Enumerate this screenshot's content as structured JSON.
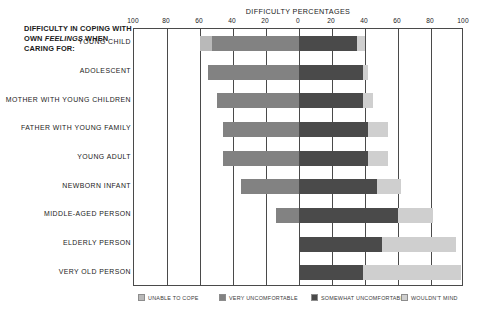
{
  "title_block": {
    "line1": "DIFFICULTY IN COPING WITH",
    "line2_pre": "OWN ",
    "line2_em": "FEELINGS",
    "line2_post": " WHEN",
    "line3": "CARING FOR:"
  },
  "axis": {
    "title": "DIFFICULTY PERCENTAGES",
    "tick_labels": [
      "100",
      "80",
      "60",
      "40",
      "20",
      "0",
      "20",
      "40",
      "60",
      "80",
      "100"
    ]
  },
  "legend": {
    "items": [
      {
        "label": "UNABLE TO COPE",
        "color": "#b9b9b9"
      },
      {
        "label": "VERY UNCOMFORTABLE",
        "color": "#828282"
      },
      {
        "label": "SOMEWHAT UNCOMFORTABLE",
        "color": "#4a4a4a"
      },
      {
        "label": "WOULDN'T MIND",
        "color": "#cfcfcf"
      }
    ]
  },
  "chart_data": {
    "type": "bar",
    "subtype": "diverging-stacked-horizontal",
    "title": "DIFFICULTY PERCENTAGES",
    "xlabel": "DIFFICULTY PERCENTAGES",
    "ylabel": "DIFFICULTY IN COPING WITH OWN FEELINGS WHEN CARING FOR:",
    "xlim": [
      -100,
      100
    ],
    "xticks": [
      -100,
      -80,
      -60,
      -40,
      -20,
      0,
      20,
      40,
      60,
      80,
      100
    ],
    "xtick_labels": [
      "100",
      "80",
      "60",
      "40",
      "20",
      "0",
      "20",
      "40",
      "60",
      "80",
      "100"
    ],
    "grid": true,
    "legend_position": "bottom",
    "categories": [
      "YOUNG CHILD",
      "ADOLESCENT",
      "MOTHER WITH YOUNG CHILDREN",
      "FATHER WITH YOUNG FAMILY",
      "YOUNG ADULT",
      "NEWBORN INFANT",
      "MIDDLE-AGED PERSON",
      "ELDERLY PERSON",
      "VERY OLD PERSON"
    ],
    "series": [
      {
        "name": "UNABLE TO COPE",
        "color": "#b9b9b9",
        "side": "left",
        "values": [
          7,
          0,
          0,
          0,
          0,
          0,
          0,
          0,
          0
        ]
      },
      {
        "name": "VERY UNCOMFORTABLE",
        "color": "#828282",
        "side": "left",
        "values": [
          53,
          55,
          50,
          46,
          46,
          35,
          14,
          0,
          0
        ]
      },
      {
        "name": "SOMEWHAT UNCOMFORTABLE",
        "color": "#4a4a4a",
        "side": "right",
        "values": [
          35,
          39,
          39,
          42,
          42,
          47,
          60,
          50,
          39
        ]
      },
      {
        "name": "WOULDN'T MIND",
        "color": "#cfcfcf",
        "side": "right",
        "values": [
          5,
          3,
          6,
          12,
          12,
          15,
          21,
          45,
          59
        ]
      }
    ],
    "rows": [
      {
        "category": "YOUNG CHILD",
        "unable_to_cope": 7,
        "very_uncomfortable": 53,
        "somewhat_uncomfortable": 35,
        "wouldnt_mind": 5
      },
      {
        "category": "ADOLESCENT",
        "unable_to_cope": 0,
        "very_uncomfortable": 55,
        "somewhat_uncomfortable": 39,
        "wouldnt_mind": 3
      },
      {
        "category": "MOTHER WITH YOUNG CHILDREN",
        "unable_to_cope": 0,
        "very_uncomfortable": 50,
        "somewhat_uncomfortable": 39,
        "wouldnt_mind": 6
      },
      {
        "category": "FATHER WITH YOUNG FAMILY",
        "unable_to_cope": 0,
        "very_uncomfortable": 46,
        "somewhat_uncomfortable": 42,
        "wouldnt_mind": 12
      },
      {
        "category": "YOUNG ADULT",
        "unable_to_cope": 0,
        "very_uncomfortable": 46,
        "somewhat_uncomfortable": 42,
        "wouldnt_mind": 12
      },
      {
        "category": "NEWBORN INFANT",
        "unable_to_cope": 0,
        "very_uncomfortable": 35,
        "somewhat_uncomfortable": 47,
        "wouldnt_mind": 15
      },
      {
        "category": "MIDDLE-AGED PERSON",
        "unable_to_cope": 0,
        "very_uncomfortable": 14,
        "somewhat_uncomfortable": 60,
        "wouldnt_mind": 21
      },
      {
        "category": "ELDERLY PERSON",
        "unable_to_cope": 0,
        "very_uncomfortable": 0,
        "somewhat_uncomfortable": 50,
        "wouldnt_mind": 45
      },
      {
        "category": "VERY OLD PERSON",
        "unable_to_cope": 0,
        "very_uncomfortable": 0,
        "somewhat_uncomfortable": 39,
        "wouldnt_mind": 59
      }
    ]
  }
}
